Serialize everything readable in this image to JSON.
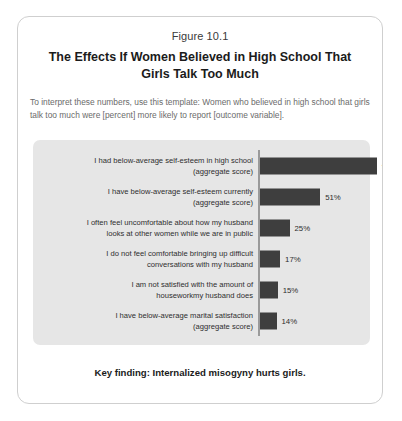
{
  "figure": {
    "number": "Figure 10.1",
    "title": "The Effects If Women Believed in High School That Girls Talk Too Much",
    "subtitle": "To interpret these numbers, use this template: Women who believed in high school that girls talk too much were [percent] more likely to report [outcome variable].",
    "key_finding": "Key finding: Internalized misogyny hurts girls."
  },
  "colors": {
    "bar": "#3e3e3e",
    "panel_background": "#e6e6e6",
    "card_border": "#cfcfcf",
    "axis_line": "#9a9a9a",
    "title_text": "#1b1b1b",
    "subtitle_text": "#6b6b6b"
  },
  "chart_data": {
    "type": "bar",
    "orientation": "horizontal",
    "title": "The Effects If Women Believed in High School That Girls Talk Too Much",
    "subtitle": "To interpret these numbers, use this template: Women who believed in high school that girls talk too much were [percent] more likely to report [outcome variable].",
    "xlabel": "",
    "ylabel": "",
    "xlim": [
      0,
      100
    ],
    "grid": false,
    "legend": false,
    "value_suffix": "%",
    "categories": [
      "I had below-average self-esteem in high school (aggregate score)",
      "I have below-average self-esteem currently (aggregate score)",
      "I often feel uncomfortable about how my husband looks at other women while we are in public",
      "I do not feel comfortable bringing up difficult conversations with my husband",
      "I am not satisfied with the amount of houseworkmy husband does",
      "I have below-average marital satisfaction (aggregate score)"
    ],
    "values": [
      99,
      51,
      25,
      17,
      15,
      14
    ],
    "bars": [
      {
        "label_line1": "I had below-average self-esteem in high school",
        "label_line2": "(aggregate score)",
        "value": 99,
        "value_label": "99%"
      },
      {
        "label_line1": "I have below-average self-esteem currently",
        "label_line2": "(aggregate score)",
        "value": 51,
        "value_label": "51%"
      },
      {
        "label_line1": "I often feel uncomfortable about how my husband",
        "label_line2": "looks at other women while we are in public",
        "value": 25,
        "value_label": "25%"
      },
      {
        "label_line1": "I do not feel comfortable bringing up difficult",
        "label_line2": "conversations with my husband",
        "value": 17,
        "value_label": "17%"
      },
      {
        "label_line1": "I am not satisfied with the amount of",
        "label_line2": "houseworkmy husband does",
        "value": 15,
        "value_label": "15%"
      },
      {
        "label_line1": "I have below-average marital satisfaction",
        "label_line2": "(aggregate score)",
        "value": 14,
        "value_label": "14%"
      }
    ]
  }
}
